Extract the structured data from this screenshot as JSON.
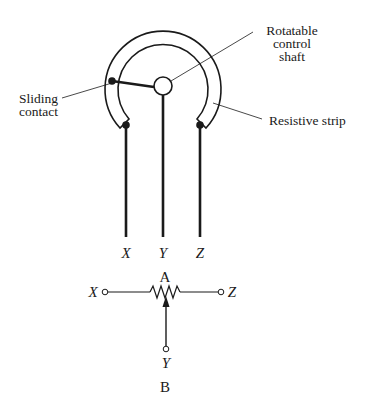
{
  "diagram": {
    "panel_a": {
      "caption": "A",
      "labels": {
        "shaft_line1": "Rotatable",
        "shaft_line2": "control",
        "shaft_line3": "shaft",
        "slider_line1": "Sliding",
        "slider_line2": "contact",
        "strip": "Resistive strip"
      },
      "terminals": {
        "x": "X",
        "y": "Y",
        "z": "Z"
      }
    },
    "panel_b": {
      "caption": "B",
      "terminals": {
        "x": "X",
        "y": "Y",
        "z": "Z"
      }
    },
    "colors": {
      "ink": "#1a1a1a",
      "background": "#ffffff"
    }
  }
}
